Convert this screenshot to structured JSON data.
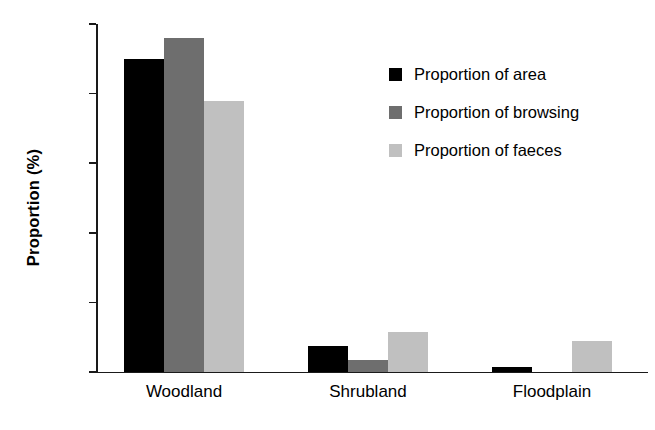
{
  "chart_data": {
    "type": "bar",
    "title": "",
    "xlabel": "",
    "ylabel": "Proportion (%)",
    "categories": [
      "Woodland",
      "Shrubland",
      "Floodplain"
    ],
    "series": [
      {
        "name": "Proportion of area",
        "color": "#000000",
        "values": [
          90,
          7.5,
          1.5
        ]
      },
      {
        "name": "Proportion of browsing",
        "color": "#6e6e6e",
        "values": [
          96,
          3.5,
          0
        ]
      },
      {
        "name": "Proportion of faeces",
        "color": "#c0c0c0",
        "values": [
          78,
          11.5,
          9
        ]
      }
    ],
    "ylim": [
      0,
      100
    ],
    "yticks": [
      0,
      20,
      40,
      60,
      80,
      100
    ],
    "ytick_labels": [
      "0",
      "20",
      "40",
      "60",
      "80",
      "100"
    ],
    "grid": false,
    "legend_position": "top-right"
  }
}
